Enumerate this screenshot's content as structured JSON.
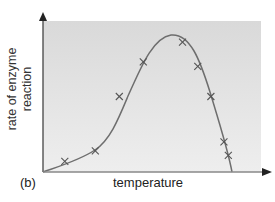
{
  "chart_data": {
    "type": "scatter",
    "panel_label": "(b)",
    "title": "",
    "xlabel": "temperature",
    "ylabel": "rate of enzyme reaction",
    "ylabel_lines": [
      "rate of enzyme",
      "reaction"
    ],
    "grid": false,
    "legend": null,
    "axes": {
      "x_ticks": [],
      "y_ticks": [],
      "arrows": true
    },
    "xlim": [
      0,
      100
    ],
    "ylim": [
      0,
      100
    ],
    "series": [
      {
        "name": "measured rate",
        "marker": "x",
        "x": [
          10,
          24,
          35,
          46,
          64,
          71,
          77,
          83,
          85
        ],
        "y": [
          7,
          14,
          50,
          73,
          86,
          70,
          50,
          20,
          11
        ]
      },
      {
        "name": "fitted curve",
        "style": "line",
        "x": [
          0,
          10,
          24,
          35,
          46,
          58,
          64,
          71,
          77,
          83,
          87
        ],
        "y": [
          0,
          7,
          16,
          38,
          73,
          90,
          86,
          70,
          50,
          20,
          0
        ]
      }
    ],
    "annotations": [
      "peak rate at optimum temperature ~58% along x-axis"
    ],
    "colors": {
      "panel_bg": "#dedede",
      "curve": "#6e6e6e",
      "marker": "#555555",
      "axis": "#444444"
    }
  }
}
